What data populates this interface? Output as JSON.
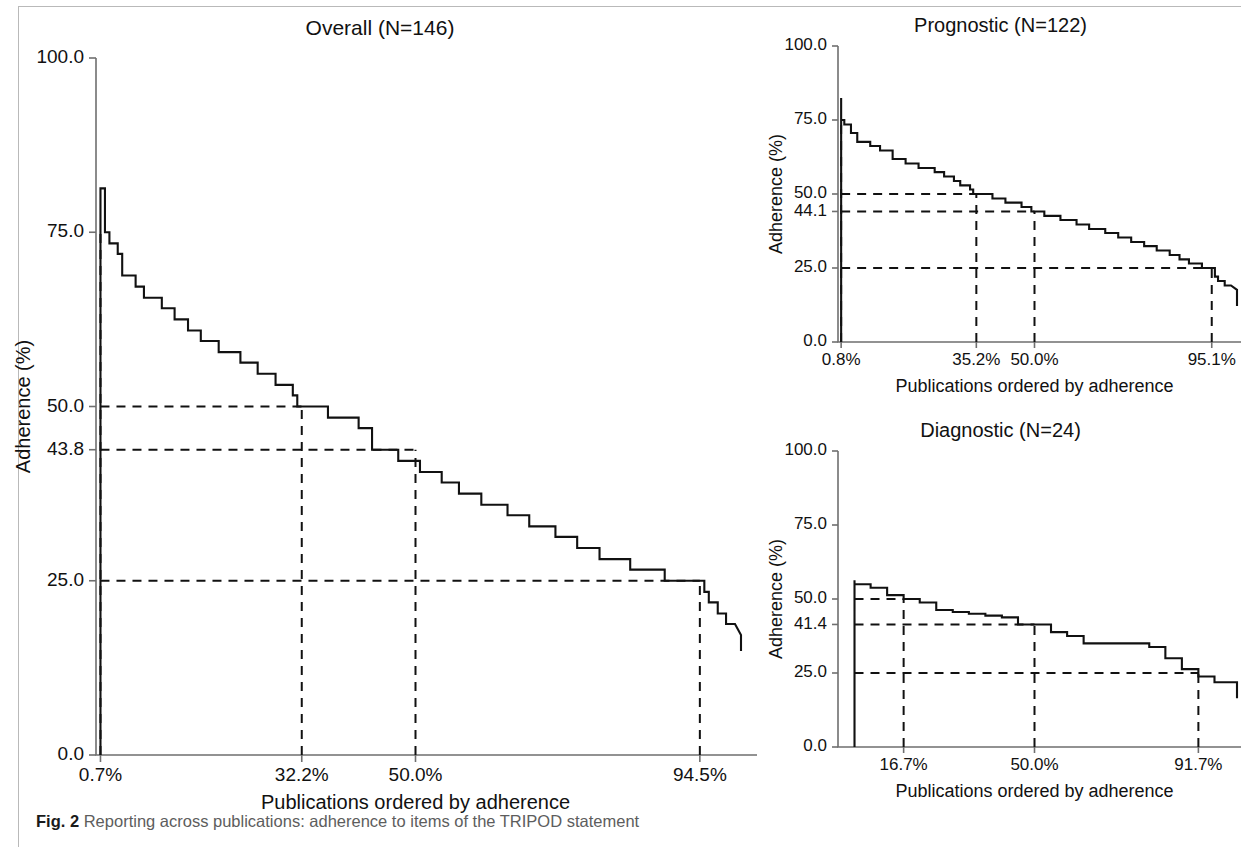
{
  "caption": {
    "figure_label": "Fig. 2",
    "text": "Reporting across publications: adherence to items of the TRIPOD statement"
  },
  "chart_data": [
    {
      "id": "overall",
      "type": "line",
      "subtype": "step",
      "title": "Overall (N=146)",
      "xlabel": "Publications ordered by adherence",
      "ylabel": "Adherence (%)",
      "n": 146,
      "xlim": [
        0,
        100
      ],
      "ylim": [
        0,
        100
      ],
      "grid": false,
      "legend": "none",
      "ytick_labels": [
        "100.0",
        "75.0",
        "50.0",
        "43.8",
        "25.0",
        "0.0"
      ],
      "ytick_values": [
        100.0,
        75.0,
        50.0,
        43.8,
        25.0,
        0.0
      ],
      "xtick_labels": [
        "0.7%",
        "32.2%",
        "50.0%",
        "94.5%"
      ],
      "xtick_values": [
        0.7,
        32.2,
        50.0,
        94.5
      ],
      "reference_lines": [
        {
          "orientation": "horizontal",
          "value": 50.0,
          "label": "50.0",
          "x_from": 0.7,
          "x_to": 32.2
        },
        {
          "orientation": "horizontal",
          "value": 43.8,
          "label": "43.8",
          "x_from": 0.7,
          "x_to": 50.0
        },
        {
          "orientation": "horizontal",
          "value": 25.0,
          "label": "25.0",
          "x_from": 0.7,
          "x_to": 94.5
        },
        {
          "orientation": "vertical",
          "value": 0.7,
          "label": "0.7%",
          "y_from": 0.0,
          "y_to": 75.0
        },
        {
          "orientation": "vertical",
          "value": 32.2,
          "label": "32.2%",
          "y_from": 0.0,
          "y_to": 50.0
        },
        {
          "orientation": "vertical",
          "value": 50.0,
          "label": "50.0%",
          "y_from": 0.0,
          "y_to": 43.8
        },
        {
          "orientation": "vertical",
          "value": 94.5,
          "label": "94.5%",
          "y_from": 0.0,
          "y_to": 25.0
        }
      ],
      "x_percent": [
        0.7,
        1.4,
        2.1,
        2.7,
        3.4,
        4.1,
        4.8,
        5.5,
        6.2,
        6.8,
        7.5,
        8.2,
        8.9,
        9.6,
        10.3,
        11.0,
        11.6,
        12.3,
        13.0,
        13.7,
        14.4,
        15.1,
        15.8,
        16.4,
        17.1,
        17.8,
        18.5,
        19.2,
        19.9,
        20.5,
        21.2,
        21.9,
        22.6,
        23.3,
        24.0,
        24.7,
        25.3,
        26.0,
        26.7,
        27.4,
        28.1,
        28.8,
        29.5,
        30.1,
        30.8,
        31.5,
        32.2,
        32.9,
        33.6,
        34.2,
        34.9,
        35.6,
        36.3,
        37.0,
        37.7,
        38.4,
        39.0,
        39.7,
        40.4,
        41.1,
        41.8,
        42.5,
        43.2,
        43.8,
        44.5,
        45.2,
        45.9,
        46.6,
        47.3,
        47.9,
        48.6,
        49.3,
        50.0,
        50.7,
        51.4,
        52.1,
        52.7,
        53.4,
        54.1,
        54.8,
        55.5,
        56.2,
        56.8,
        57.5,
        58.2,
        58.9,
        59.6,
        60.3,
        61.0,
        61.6,
        62.3,
        63.0,
        63.7,
        64.4,
        65.1,
        65.8,
        66.4,
        67.1,
        67.8,
        68.5,
        69.2,
        69.9,
        70.5,
        71.2,
        71.9,
        72.6,
        73.3,
        74.0,
        74.7,
        75.3,
        76.0,
        76.7,
        77.4,
        78.1,
        78.8,
        79.5,
        80.1,
        80.8,
        81.5,
        82.2,
        82.9,
        83.6,
        84.2,
        84.9,
        85.6,
        86.3,
        87.0,
        87.7,
        88.4,
        89.0,
        89.7,
        90.4,
        91.1,
        91.8,
        92.5,
        93.2,
        93.8,
        94.5,
        95.2,
        95.9,
        96.6,
        97.3,
        97.9,
        98.6,
        99.3,
        100.0
      ],
      "adherence_percent": [
        81.3,
        81.3,
        75.0,
        73.4,
        73.4,
        71.9,
        68.8,
        68.8,
        68.8,
        67.2,
        67.2,
        65.6,
        65.6,
        65.6,
        65.6,
        64.1,
        64.1,
        64.1,
        62.5,
        62.5,
        62.5,
        60.9,
        60.9,
        60.9,
        59.4,
        59.4,
        59.4,
        59.4,
        57.8,
        57.8,
        57.8,
        57.8,
        57.8,
        56.3,
        56.3,
        56.3,
        56.3,
        54.7,
        54.7,
        54.7,
        54.7,
        53.1,
        53.1,
        53.1,
        53.1,
        51.6,
        50.0,
        50.0,
        50.0,
        50.0,
        50.0,
        50.0,
        50.0,
        48.4,
        48.4,
        48.4,
        48.4,
        48.4,
        48.4,
        48.4,
        46.9,
        46.9,
        46.9,
        43.8,
        43.8,
        43.8,
        43.8,
        43.8,
        43.8,
        42.2,
        42.2,
        42.2,
        42.2,
        42.2,
        40.6,
        40.6,
        40.6,
        40.6,
        40.6,
        39.1,
        39.1,
        39.1,
        39.1,
        37.5,
        37.5,
        37.5,
        37.5,
        37.5,
        35.9,
        35.9,
        35.9,
        35.9,
        35.9,
        35.9,
        34.4,
        34.4,
        34.4,
        34.4,
        34.4,
        32.8,
        32.8,
        32.8,
        32.8,
        32.8,
        32.8,
        31.3,
        31.3,
        31.3,
        31.3,
        31.3,
        29.7,
        29.7,
        29.7,
        29.7,
        29.7,
        28.1,
        28.1,
        28.1,
        28.1,
        28.1,
        28.1,
        28.1,
        26.6,
        26.6,
        26.6,
        26.6,
        26.6,
        26.6,
        26.6,
        26.6,
        25.0,
        25.0,
        25.0,
        25.0,
        25.0,
        25.0,
        25.0,
        25.0,
        25.0,
        23.4,
        21.9,
        21.9,
        20.3,
        20.3,
        18.8,
        18.8,
        17.2,
        17.2
      ]
    },
    {
      "id": "prognostic",
      "type": "line",
      "subtype": "step",
      "title": "Prognostic (N=122)",
      "xlabel": "Publications ordered by adherence",
      "ylabel": "Adherence (%)",
      "n": 122,
      "xlim": [
        0,
        100
      ],
      "ylim": [
        0,
        100
      ],
      "grid": false,
      "legend": "none",
      "ytick_labels": [
        "100.0",
        "75.0",
        "50.0",
        "44.1",
        "25.0",
        "0.0"
      ],
      "ytick_values": [
        100.0,
        75.0,
        50.0,
        44.1,
        25.0,
        0.0
      ],
      "xtick_labels": [
        "0.8%",
        "35.2%",
        "50.0%",
        "95.1%"
      ],
      "xtick_values": [
        0.8,
        35.2,
        50.0,
        95.1
      ],
      "reference_lines": [
        {
          "orientation": "horizontal",
          "value": 50.0,
          "label": "50.0",
          "x_from": 0.8,
          "x_to": 35.2
        },
        {
          "orientation": "horizontal",
          "value": 44.1,
          "label": "44.1",
          "x_from": 0.8,
          "x_to": 50.0
        },
        {
          "orientation": "horizontal",
          "value": 25.0,
          "label": "25.0",
          "x_from": 0.8,
          "x_to": 95.1
        },
        {
          "orientation": "vertical",
          "value": 0.8,
          "label": "0.8%",
          "y_from": 0.0,
          "y_to": 75.0
        },
        {
          "orientation": "vertical",
          "value": 35.2,
          "label": "35.2%",
          "y_from": 0.0,
          "y_to": 50.0
        },
        {
          "orientation": "vertical",
          "value": 50.0,
          "label": "50.0%",
          "y_from": 0.0,
          "y_to": 44.1
        },
        {
          "orientation": "vertical",
          "value": 95.1,
          "label": "95.1%",
          "y_from": 0.0,
          "y_to": 25.0
        }
      ],
      "x_percent": [
        0.8,
        1.6,
        2.5,
        3.3,
        4.1,
        4.9,
        5.7,
        6.6,
        7.4,
        8.2,
        9.0,
        9.8,
        10.7,
        11.5,
        12.3,
        13.1,
        13.9,
        14.8,
        15.6,
        16.4,
        17.2,
        18.0,
        18.9,
        19.7,
        20.5,
        21.3,
        22.1,
        23.0,
        23.8,
        24.6,
        25.4,
        26.2,
        27.0,
        27.9,
        28.7,
        29.5,
        30.3,
        31.1,
        32.0,
        32.8,
        33.6,
        34.4,
        35.2,
        36.1,
        36.9,
        37.7,
        38.5,
        39.3,
        40.2,
        41.0,
        41.8,
        42.6,
        43.4,
        44.3,
        45.1,
        45.9,
        46.7,
        47.5,
        48.4,
        49.2,
        50.0,
        50.8,
        51.6,
        52.5,
        53.3,
        54.1,
        54.9,
        55.7,
        56.6,
        57.4,
        58.2,
        59.0,
        59.8,
        60.7,
        61.5,
        62.3,
        63.1,
        63.9,
        64.8,
        65.6,
        66.4,
        67.2,
        68.0,
        68.9,
        69.7,
        70.5,
        71.3,
        72.1,
        73.0,
        73.8,
        74.6,
        75.4,
        76.2,
        77.0,
        77.9,
        78.7,
        79.5,
        80.3,
        81.1,
        82.0,
        82.8,
        83.6,
        84.4,
        85.2,
        86.1,
        86.9,
        87.7,
        88.5,
        89.3,
        90.2,
        91.0,
        91.8,
        92.6,
        93.4,
        94.3,
        95.1,
        95.9,
        96.7,
        97.5,
        98.4,
        99.2,
        100.0
      ],
      "adherence_percent": [
        82.4,
        75.0,
        73.5,
        73.5,
        70.6,
        70.6,
        67.6,
        67.6,
        67.6,
        67.6,
        66.2,
        66.2,
        66.2,
        64.7,
        64.7,
        64.7,
        64.7,
        61.8,
        61.8,
        61.8,
        61.8,
        60.3,
        60.3,
        60.3,
        60.3,
        58.8,
        58.8,
        58.8,
        58.8,
        58.8,
        57.4,
        57.4,
        57.4,
        55.9,
        55.9,
        55.9,
        54.4,
        54.4,
        52.9,
        52.9,
        52.9,
        51.5,
        50.0,
        50.0,
        50.0,
        50.0,
        50.0,
        50.0,
        48.5,
        48.5,
        48.5,
        48.5,
        47.1,
        47.1,
        47.1,
        47.1,
        47.1,
        45.6,
        45.6,
        45.6,
        44.1,
        44.1,
        44.1,
        44.1,
        42.6,
        42.6,
        42.6,
        42.6,
        42.6,
        41.2,
        41.2,
        41.2,
        41.2,
        41.2,
        39.7,
        39.7,
        39.7,
        39.7,
        38.2,
        38.2,
        38.2,
        38.2,
        38.2,
        36.8,
        36.8,
        36.8,
        36.8,
        35.3,
        35.3,
        35.3,
        35.3,
        33.8,
        33.8,
        33.8,
        33.8,
        32.4,
        32.4,
        32.4,
        32.4,
        30.9,
        30.9,
        30.9,
        30.9,
        29.4,
        29.4,
        29.4,
        27.9,
        27.9,
        27.9,
        26.5,
        26.5,
        26.5,
        26.5,
        25.0,
        25.0,
        25.0,
        25.0,
        22.1,
        20.6,
        20.6,
        19.1,
        19.1,
        17.6,
        17.6
      ]
    },
    {
      "id": "diagnostic",
      "type": "line",
      "subtype": "step",
      "title": "Diagnostic (N=24)",
      "xlabel": "Publications ordered by adherence",
      "ylabel": "Adherence (%)",
      "n": 24,
      "xlim": [
        0,
        100
      ],
      "ylim": [
        0,
        100
      ],
      "grid": false,
      "legend": "none",
      "ytick_labels": [
        "100.0",
        "75.0",
        "50.0",
        "41.4",
        "25.0",
        "0.0"
      ],
      "ytick_values": [
        100.0,
        75.0,
        50.0,
        41.4,
        25.0,
        0.0
      ],
      "xtick_labels": [
        "16.7%",
        "50.0%",
        "91.7%"
      ],
      "xtick_values": [
        16.7,
        50.0,
        91.7
      ],
      "reference_lines": [
        {
          "orientation": "horizontal",
          "value": 50.0,
          "label": "50.0",
          "x_from": 4.2,
          "x_to": 16.7
        },
        {
          "orientation": "horizontal",
          "value": 41.4,
          "label": "41.4",
          "x_from": 4.2,
          "x_to": 50.0
        },
        {
          "orientation": "horizontal",
          "value": 25.0,
          "label": "25.0",
          "x_from": 4.2,
          "x_to": 91.7
        },
        {
          "orientation": "vertical",
          "value": 16.7,
          "label": "16.7%",
          "y_from": 0.0,
          "y_to": 50.0
        },
        {
          "orientation": "vertical",
          "value": 50.0,
          "label": "50.0%",
          "y_from": 0.0,
          "y_to": 41.4
        },
        {
          "orientation": "vertical",
          "value": 91.7,
          "label": "91.7%",
          "y_from": 0.0,
          "y_to": 25.0
        }
      ],
      "x_percent": [
        4.2,
        8.3,
        12.5,
        16.7,
        20.8,
        25.0,
        29.2,
        33.3,
        37.5,
        41.7,
        45.8,
        50.0,
        54.2,
        58.3,
        62.5,
        66.7,
        70.8,
        75.0,
        79.2,
        83.3,
        87.5,
        91.7,
        95.8,
        100.0
      ],
      "adherence_percent": [
        56.3,
        55.0,
        53.8,
        51.3,
        50.0,
        48.8,
        46.3,
        45.6,
        45.0,
        44.4,
        43.8,
        41.4,
        41.4,
        38.8,
        37.5,
        35.0,
        35.0,
        35.0,
        35.0,
        33.8,
        30.0,
        26.3,
        23.8,
        21.9
      ]
    }
  ]
}
